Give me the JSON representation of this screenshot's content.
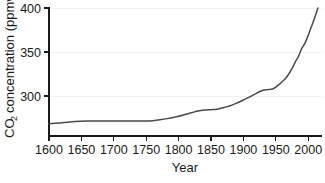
{
  "chart_data": {
    "type": "line",
    "title": "",
    "xlabel": "Year",
    "ylabel": "CO2 concentration (ppmv)",
    "ylabel_main": "concentration (ppmv)",
    "ylabel_prefix": "CO",
    "ylabel_subscript": "2",
    "xlim": [
      1600,
      2015
    ],
    "ylim": [
      255,
      400
    ],
    "xticks": [
      1600,
      1650,
      1700,
      1750,
      1800,
      1850,
      1900,
      1950,
      2000
    ],
    "xtick_labels": [
      "1600",
      "1650",
      "1700",
      "1750",
      "1800",
      "1850",
      "1900",
      "1950",
      "2000"
    ],
    "yticks": [
      300,
      350,
      400
    ],
    "ytick_labels": [
      "300",
      "350",
      "400"
    ],
    "grid": "horizontal-faint",
    "legend": "none",
    "line_color": "#4a4a4a",
    "axis_color": "#1a1a1a",
    "grid_color": "#f1f1f1",
    "x": [
      1600,
      1620,
      1640,
      1660,
      1680,
      1700,
      1720,
      1740,
      1750,
      1760,
      1780,
      1800,
      1820,
      1830,
      1840,
      1850,
      1860,
      1870,
      1880,
      1890,
      1900,
      1910,
      1920,
      1930,
      1935,
      1940,
      1945,
      1950,
      1955,
      1960,
      1965,
      1970,
      1975,
      1980,
      1985,
      1990,
      1995,
      2000,
      2005,
      2010,
      2015
    ],
    "y": [
      268.5,
      269.5,
      271.0,
      271.5,
      271.5,
      271.5,
      271.5,
      271.5,
      271.5,
      272.0,
      274.0,
      277.0,
      281.0,
      283.0,
      284.0,
      284.5,
      285.0,
      287.0,
      289.0,
      292.0,
      295.5,
      299.0,
      303.0,
      306.5,
      307.0,
      307.5,
      308.0,
      310.0,
      313.0,
      316.5,
      320.0,
      325.0,
      331.0,
      338.5,
      345.0,
      354.0,
      360.0,
      369.0,
      379.0,
      389.0,
      400.0
    ],
    "annotations": []
  },
  "caption_sliver": "                                                                    "
}
